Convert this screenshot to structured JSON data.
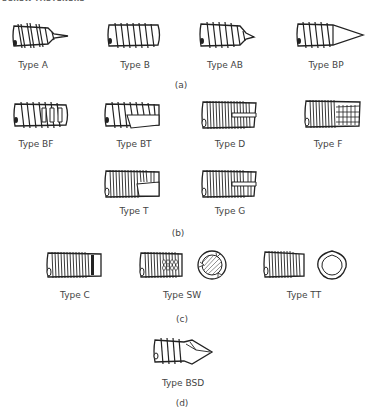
{
  "header": {
    "text": "SCREW FASTENERS"
  },
  "groups": [
    {
      "caption": "(a)",
      "items": [
        {
          "label": "Type A"
        },
        {
          "label": "Type B"
        },
        {
          "label": "Type AB"
        },
        {
          "label": "Type BP"
        }
      ]
    },
    {
      "caption": "(b)",
      "items": [
        {
          "label": "Type BF"
        },
        {
          "label": "Type BT"
        },
        {
          "label": "Type D"
        },
        {
          "label": "Type F"
        },
        {
          "label": "Type T"
        },
        {
          "label": "Type G"
        }
      ]
    },
    {
      "caption": "(c)",
      "items": [
        {
          "label": "Type C"
        },
        {
          "label": "Type SW"
        },
        {
          "label": "Type TT"
        }
      ]
    },
    {
      "caption": "(d)",
      "items": [
        {
          "label": "Type BSD"
        }
      ]
    }
  ]
}
